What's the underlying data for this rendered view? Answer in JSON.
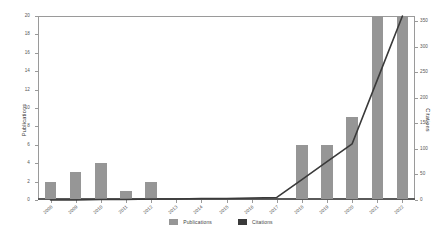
{
  "chart_data": {
    "type": "bar",
    "title": "",
    "subtitle": "",
    "xlabel": "",
    "ylabel": "Publications",
    "y2label": "Citations",
    "categories": [
      "2008",
      "2009",
      "2010",
      "2011",
      "2012",
      "2013",
      "2014",
      "2015",
      "2016",
      "2017",
      "2018",
      "2019",
      "2020",
      "2021",
      "2022"
    ],
    "ylim": [
      0,
      20
    ],
    "y2lim": [
      0,
      360
    ],
    "yticks": [
      0,
      2,
      4,
      6,
      8,
      10,
      12,
      14,
      16,
      18,
      20
    ],
    "y2ticks": [
      0,
      50,
      100,
      150,
      200,
      250,
      300,
      350
    ],
    "grid": false,
    "legend_position": "bottom",
    "series": [
      {
        "name": "Publications",
        "type": "bar",
        "axis": "left",
        "color": "#969696",
        "values": [
          2,
          3,
          4,
          1,
          2,
          0,
          0,
          0,
          0,
          0,
          6,
          6,
          9,
          20,
          20
        ]
      },
      {
        "name": "Citations",
        "type": "line",
        "axis": "right",
        "color": "#3a3a3a",
        "values": [
          0,
          0,
          1,
          1,
          2,
          2,
          3,
          3,
          4,
          5,
          40,
          75,
          110,
          235,
          360
        ]
      }
    ]
  },
  "legend": {
    "items": [
      {
        "label": "Publications",
        "color": "#969696"
      },
      {
        "label": "Citations",
        "color": "#3a3a3a"
      }
    ]
  }
}
